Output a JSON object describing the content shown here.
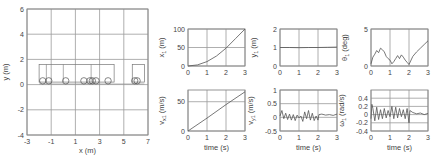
{
  "chart_data": [
    {
      "id": "trajectory",
      "type": "line",
      "title": "",
      "xlabel": "x (m)",
      "ylabel": "y (m)",
      "xlim": [
        -3,
        7
      ],
      "ylim": [
        -4,
        6
      ],
      "xticks": [
        "-3",
        "-1",
        "1",
        "3",
        "5",
        "7"
      ],
      "yticks": [
        "6",
        "4",
        "2",
        "0",
        "-2",
        "-4"
      ],
      "grid": true,
      "annotations": "Snapshots of a tractor-trailer vehicle (rectangular bodies ~1.5 m tall, wheels as circles at y≈0.3) along y≈0 from x≈-2 to x≈6.5",
      "vehicle_snapshots": [
        {
          "x_start": -2.0,
          "x_end": 4.2,
          "y_bottom": 0.2,
          "y_top": 1.6
        },
        {
          "x_start": 5.7,
          "x_end": 6.7,
          "y_bottom": 0.2,
          "y_top": 1.6
        }
      ],
      "wheels_x": [
        -1.7,
        -1.2,
        0.2,
        1.7,
        2.2,
        2.4,
        2.7,
        3.7,
        5.9,
        6.1
      ]
    },
    {
      "id": "x1",
      "type": "line",
      "xlabel": "",
      "ylabel": "x_1 (m)",
      "xlim": [
        0,
        3
      ],
      "ylim": [
        0,
        100
      ],
      "xticks": [
        "0",
        "1",
        "2",
        "3"
      ],
      "yticks": [
        "100",
        "50",
        "0"
      ],
      "grid": true,
      "x": [
        0,
        0.5,
        1.0,
        1.5,
        2.0,
        2.5,
        3.0
      ],
      "values": [
        0,
        3,
        12,
        27,
        48,
        74,
        100
      ]
    },
    {
      "id": "y1",
      "type": "line",
      "xlabel": "",
      "ylabel": "y_1 (m)",
      "xlim": [
        0,
        3
      ],
      "ylim": [
        0,
        2
      ],
      "xticks": [
        "0",
        "1",
        "2",
        "3"
      ],
      "yticks": [
        "2",
        "1",
        "0"
      ],
      "grid": true,
      "x": [
        0,
        0.5,
        1.0,
        1.5,
        2.0,
        2.5,
        3.0
      ],
      "values": [
        1.0,
        1.0,
        0.99,
        1.0,
        1.0,
        1.01,
        1.02
      ]
    },
    {
      "id": "theta1",
      "type": "line",
      "xlabel": "",
      "ylabel": "θ_1 (deg)",
      "xlim": [
        0,
        3
      ],
      "ylim": [
        0,
        5
      ],
      "xticks": [
        "0",
        "1",
        "2",
        "3"
      ],
      "yticks": [
        "5",
        "0"
      ],
      "grid": true,
      "x": [
        0,
        0.1,
        0.2,
        0.3,
        0.4,
        0.5,
        0.6,
        0.7,
        0.8,
        0.9,
        1.0,
        1.1,
        1.2,
        1.3,
        1.4,
        1.5,
        1.6,
        1.7,
        1.8,
        1.9,
        2.0,
        2.2,
        2.4,
        2.6,
        2.8,
        3.0
      ],
      "values": [
        0.3,
        1.2,
        1.6,
        2.1,
        1.8,
        2.4,
        2.2,
        1.9,
        1.3,
        1.0,
        0.8,
        0.3,
        0.6,
        1.0,
        1.4,
        1.0,
        1.5,
        1.2,
        0.8,
        0.5,
        0.2,
        1.3,
        1.9,
        2.4,
        2.9,
        3.4
      ]
    },
    {
      "id": "vx1",
      "type": "line",
      "xlabel": "time (s)",
      "ylabel": "v_x1 (m/s)",
      "xlim": [
        0,
        3
      ],
      "ylim": [
        0,
        70
      ],
      "xticks": [
        "0",
        "1",
        "2",
        "3"
      ],
      "yticks": [
        "50",
        "0"
      ],
      "grid": true,
      "x": [
        0,
        1,
        2,
        3
      ],
      "values": [
        0,
        22,
        45,
        67
      ]
    },
    {
      "id": "vy1",
      "type": "line",
      "xlabel": "time (s)",
      "ylabel": "v_y1 (m/s)",
      "xlim": [
        0,
        3
      ],
      "ylim": [
        -0.5,
        1
      ],
      "xticks": [
        "0",
        "1",
        "2",
        "3"
      ],
      "yticks": [
        "1",
        "0.5",
        "0",
        "-0.5"
      ],
      "grid": true,
      "x": [
        0,
        0.1,
        0.2,
        0.3,
        0.4,
        0.5,
        0.6,
        0.7,
        0.8,
        0.9,
        1.0,
        1.1,
        1.2,
        1.3,
        1.4,
        1.5,
        1.6,
        1.7,
        1.8,
        1.9,
        2.0,
        2.05,
        2.2,
        2.4,
        2.6,
        2.8,
        3.0
      ],
      "values": [
        0.05,
        0.25,
        -0.05,
        0.15,
        -0.08,
        0.12,
        -0.1,
        0.1,
        -0.12,
        0.08,
        -0.02,
        0.05,
        -0.15,
        0.2,
        -0.05,
        0.25,
        -0.1,
        0.15,
        -0.12,
        0.05,
        -0.1,
        0.1,
        0.12,
        0.08,
        0.1,
        0.07,
        0.12
      ]
    },
    {
      "id": "omega1",
      "type": "line",
      "xlabel": "time (s)",
      "ylabel": "ω_1 (rad/s)",
      "xlim": [
        0,
        3
      ],
      "ylim": [
        -0.4,
        0.6
      ],
      "xticks": [
        "0",
        "1",
        "2",
        "3"
      ],
      "yticks": [
        "0.4",
        "0.2",
        "0",
        "-0.2",
        "-0.4"
      ],
      "grid": true,
      "x": [
        0,
        0.05,
        0.1,
        0.2,
        0.3,
        0.4,
        0.5,
        0.6,
        0.7,
        0.8,
        0.9,
        1.0,
        1.1,
        1.2,
        1.3,
        1.4,
        1.5,
        1.6,
        1.7,
        1.8,
        1.9,
        2.0,
        2.05,
        2.2,
        2.4,
        2.6,
        2.8,
        3.0
      ],
      "values": [
        -0.1,
        0.25,
        0.15,
        -0.15,
        0.18,
        -0.12,
        0.12,
        -0.1,
        0.15,
        -0.08,
        0.1,
        -0.05,
        0.2,
        -0.1,
        0.18,
        -0.08,
        0.15,
        -0.05,
        0.12,
        -0.1,
        0.15,
        -0.2,
        0.1,
        0.05,
        0.02,
        0.04,
        0.0,
        0.03
      ]
    }
  ],
  "labels": {
    "traj_xlabel": "x (m)",
    "traj_ylabel": "y (m)",
    "x1_ylabel": "x",
    "x1_sub": "1",
    "x1_unit": "(m)",
    "y1_ylabel": "y",
    "y1_sub": "1",
    "y1_unit": "(m)",
    "th_ylabel": "θ",
    "th_sub": "1",
    "th_unit": "(deg)",
    "vx_ylabel": "v",
    "vx_sub": "x1",
    "vx_unit": "(m/s)",
    "vy_ylabel": "v",
    "vy_sub": "y1",
    "vy_unit": "(m/s)",
    "om_ylabel": "ω",
    "om_sub": "1",
    "om_unit": "(rad/s)",
    "time_label": "time (s)"
  }
}
